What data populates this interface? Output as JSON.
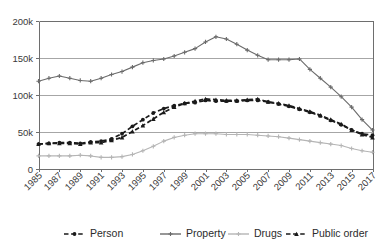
{
  "chart_data": {
    "type": "line",
    "title": "",
    "subtitle": "",
    "xlabel": "",
    "ylabel": "",
    "grid": "horizontal",
    "legend_position": "bottom",
    "ylim": [
      0,
      200000
    ],
    "ytick_labels": [
      "0",
      "50k",
      "100k",
      "150k",
      "200k"
    ],
    "ytick_values": [
      0,
      50000,
      100000,
      150000,
      200000
    ],
    "xlim": [
      1985,
      2017
    ],
    "xtick_labels": [
      "1985",
      "1987",
      "1989",
      "1991",
      "1993",
      "1995",
      "1997",
      "1999",
      "2001",
      "2003",
      "2005",
      "2007",
      "2009",
      "2011",
      "2013",
      "2015",
      "2017"
    ],
    "xtick_values": [
      1985,
      1987,
      1989,
      1991,
      1993,
      1995,
      1997,
      1999,
      2001,
      2003,
      2005,
      2007,
      2009,
      2011,
      2013,
      2015,
      2017
    ],
    "x": [
      1985,
      1986,
      1987,
      1988,
      1989,
      1990,
      1991,
      1992,
      1993,
      1994,
      1995,
      1996,
      1997,
      1998,
      1999,
      2000,
      2001,
      2002,
      2003,
      2004,
      2005,
      2006,
      2007,
      2008,
      2009,
      2010,
      2011,
      2012,
      2013,
      2014,
      2015,
      2016,
      2017
    ],
    "series": [
      {
        "name": "Person",
        "color": "#1a1a1a",
        "style": "dashed",
        "marker": "circle",
        "values": [
          33000,
          34000,
          35000,
          35000,
          34000,
          36000,
          37000,
          40000,
          47000,
          57000,
          66000,
          75000,
          81000,
          85000,
          88000,
          89000,
          92000,
          91000,
          91000,
          91000,
          92000,
          92000,
          90000,
          87000,
          84000,
          80000,
          76000,
          71000,
          65000,
          59000,
          52000,
          47000,
          45000
        ]
      },
      {
        "name": "Property",
        "color": "#6b6b6b",
        "style": "solid",
        "marker": "plus",
        "values": [
          118000,
          122000,
          125000,
          122000,
          119000,
          118000,
          122000,
          127000,
          131000,
          137000,
          143000,
          146000,
          148000,
          152000,
          157000,
          162000,
          171000,
          178000,
          175000,
          168000,
          160000,
          153000,
          147000,
          147000,
          147000,
          148000,
          134000,
          122000,
          110000,
          97000,
          83000,
          66000,
          52000
        ]
      },
      {
        "name": "Drugs",
        "color": "#b5b5b5",
        "style": "solid",
        "marker": "plus",
        "values": [
          17000,
          17000,
          17000,
          17000,
          18000,
          17000,
          15000,
          15000,
          16000,
          19000,
          24000,
          30000,
          37000,
          42000,
          45000,
          47000,
          47000,
          47000,
          46000,
          46000,
          46000,
          45000,
          44000,
          43000,
          41000,
          39000,
          37000,
          35000,
          33000,
          31000,
          27000,
          24000,
          22000
        ]
      },
      {
        "name": "Public order",
        "color": "#1a1a1a",
        "style": "dashed",
        "marker": "triangle",
        "values": [
          33000,
          34000,
          34000,
          34000,
          33000,
          35000,
          35000,
          38000,
          42000,
          50000,
          58000,
          67000,
          76000,
          83000,
          88000,
          91000,
          94000,
          93000,
          92000,
          92000,
          93000,
          94000,
          90000,
          88000,
          85000,
          81000,
          77000,
          72000,
          66000,
          60000,
          52000,
          46000,
          42000
        ]
      }
    ]
  },
  "legend": {
    "entries": [
      {
        "label": "Person"
      },
      {
        "label": "Property"
      },
      {
        "label": "Drugs"
      },
      {
        "label": "Public order"
      }
    ]
  }
}
